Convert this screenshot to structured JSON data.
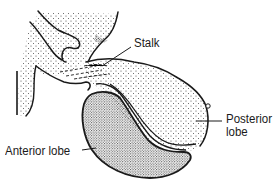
{
  "figure": {
    "labels": {
      "stalk": "Stalk",
      "posterior_line1": "Posterior",
      "posterior_line2": "lobe",
      "anterior": "Anterior lobe"
    },
    "colors": {
      "ink": "#1a1a1a",
      "background": "#ffffff",
      "stipple_light": "#555555",
      "stipple_dense": "#222222"
    }
  }
}
